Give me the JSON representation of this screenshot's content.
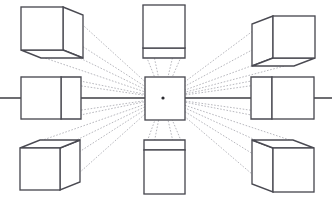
{
  "figure": {
    "canvas": {
      "width": 332,
      "height": 204,
      "background": "#ffffff"
    },
    "colors": {
      "cube_stroke": "#4a4a52",
      "horizon_stroke": "#3c3c42",
      "ray_stroke": "#9a9aa2",
      "vanishing_point": "#2a2a30",
      "face_fill": "#ffffff"
    },
    "vanishing_point": {
      "x": 163,
      "y": 98,
      "label": "VP"
    },
    "horizon": {
      "y": 98,
      "x_start": 0,
      "x_end": 332,
      "label": "Horizon line"
    },
    "cubes": [
      {
        "name": "cube-top-left",
        "position": "top-left",
        "visible_faces": [
          "front",
          "right",
          "bottom"
        ],
        "front": {
          "x": 21,
          "y": 7,
          "w": 42,
          "h": 43
        },
        "depth_dx": 20,
        "depth_dy": 8
      },
      {
        "name": "cube-top-center",
        "position": "top-center",
        "visible_faces": [
          "front",
          "bottom"
        ],
        "front": {
          "x": 143,
          "y": 5,
          "w": 42,
          "h": 43
        },
        "depth_dx": 0,
        "depth_dy": 10
      },
      {
        "name": "cube-top-right",
        "position": "top-right",
        "visible_faces": [
          "front",
          "left",
          "bottom"
        ],
        "front": {
          "x": 273,
          "y": 16,
          "w": 42,
          "h": 42
        },
        "depth_dx": -21,
        "depth_dy": 8
      },
      {
        "name": "cube-middle-left",
        "position": "middle-left",
        "visible_faces": [
          "front",
          "right"
        ],
        "front": {
          "x": 21,
          "y": 77,
          "w": 40,
          "h": 42
        },
        "depth_dx": 20,
        "depth_dy": 0
      },
      {
        "name": "cube-center",
        "position": "center",
        "visible_faces": [
          "front"
        ],
        "front": {
          "x": 145,
          "y": 77,
          "w": 40,
          "h": 43
        },
        "depth_dx": 0,
        "depth_dy": 0
      },
      {
        "name": "cube-middle-right",
        "position": "middle-right",
        "visible_faces": [
          "front",
          "left"
        ],
        "front": {
          "x": 272,
          "y": 77,
          "w": 42,
          "h": 42
        },
        "depth_dx": -21,
        "depth_dy": 0
      },
      {
        "name": "cube-bottom-left",
        "position": "bottom-left",
        "visible_faces": [
          "front",
          "top",
          "right"
        ],
        "front": {
          "x": 20,
          "y": 148,
          "w": 40,
          "h": 42
        },
        "depth_dx": 20,
        "depth_dy": -8
      },
      {
        "name": "cube-bottom-center",
        "position": "bottom-center",
        "visible_faces": [
          "front",
          "top"
        ],
        "front": {
          "x": 144,
          "y": 150,
          "w": 41,
          "h": 44
        },
        "depth_dx": 0,
        "depth_dy": -10
      },
      {
        "name": "cube-bottom-right",
        "position": "bottom-right",
        "visible_faces": [
          "front",
          "top",
          "left"
        ],
        "front": {
          "x": 273,
          "y": 148,
          "w": 41,
          "h": 44
        },
        "depth_dx": -21,
        "depth_dy": -8
      }
    ]
  }
}
